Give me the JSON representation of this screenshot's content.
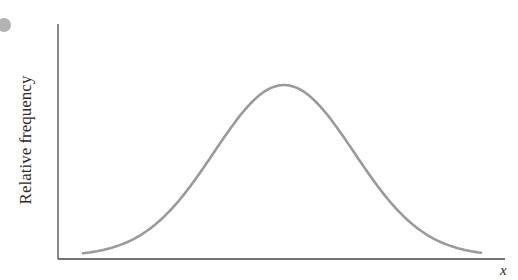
{
  "figure": {
    "y_axis_label": "Relative frequency",
    "x_axis_label": "x",
    "curve_type": "bell-shaped normal distribution",
    "colors": {
      "curve": "#9a9a9a",
      "axes": "#444444",
      "marker_dot": "#b3b3b3"
    },
    "marker": "grey circle"
  },
  "chart_data": {
    "type": "line",
    "title": "",
    "xlabel": "x",
    "ylabel": "Relative frequency",
    "ticks": "none",
    "grid": false,
    "series": [
      {
        "name": "normal curve",
        "shape": "symmetric bell curve",
        "peak_x_fraction": 0.5,
        "x": [
          0.0,
          0.1,
          0.2,
          0.3,
          0.4,
          0.5,
          0.6,
          0.7,
          0.8,
          0.9,
          1.0
        ],
        "values": [
          0.03,
          0.09,
          0.22,
          0.46,
          0.8,
          1.0,
          0.8,
          0.46,
          0.22,
          0.09,
          0.03
        ]
      }
    ]
  }
}
